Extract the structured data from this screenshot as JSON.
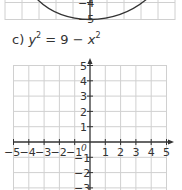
{
  "prev_graph": {
    "visible_y_labels": [
      "-4",
      "-5"
    ],
    "curve": "lower arc of previous part's ellipse/circle, minimum at y = -5"
  },
  "question": {
    "label": "c)",
    "lhs_var": "y",
    "lhs_exp": "2",
    "equals": " = 9 − ",
    "rhs_var": "x",
    "rhs_exp": "2"
  },
  "axes": {
    "x_ticks": [
      "-5",
      "-4",
      "-3",
      "-2",
      "-1",
      "1",
      "2",
      "3",
      "4",
      "5"
    ],
    "y_ticks_positive": [
      "5",
      "4",
      "3",
      "2",
      "1"
    ],
    "y_ticks_negative": [
      "-1",
      "-2",
      "-3"
    ],
    "origin_label": "0"
  },
  "colors": {
    "grid": "#cfcfcf",
    "axis": "#333333",
    "curve": "#333333"
  }
}
